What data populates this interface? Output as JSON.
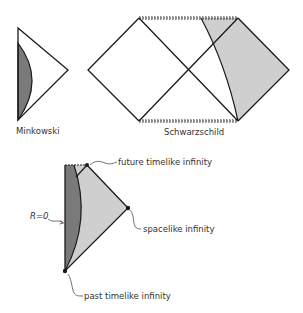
{
  "diagrams": {
    "minkowski": {
      "label": "Minkowski"
    },
    "schwarzschild": {
      "label": "Schwarzschild"
    },
    "star_collapse": {
      "r_label": "R=0",
      "future_label": "future timelike infinity",
      "spacelike_label": "spacelike infinity",
      "past_label": "past timelike infinity"
    }
  },
  "colors": {
    "line": "#1a1a1a",
    "dark_fill": "#7a7a7a",
    "light_fill": "#cfcfcf",
    "text": "#333333"
  }
}
